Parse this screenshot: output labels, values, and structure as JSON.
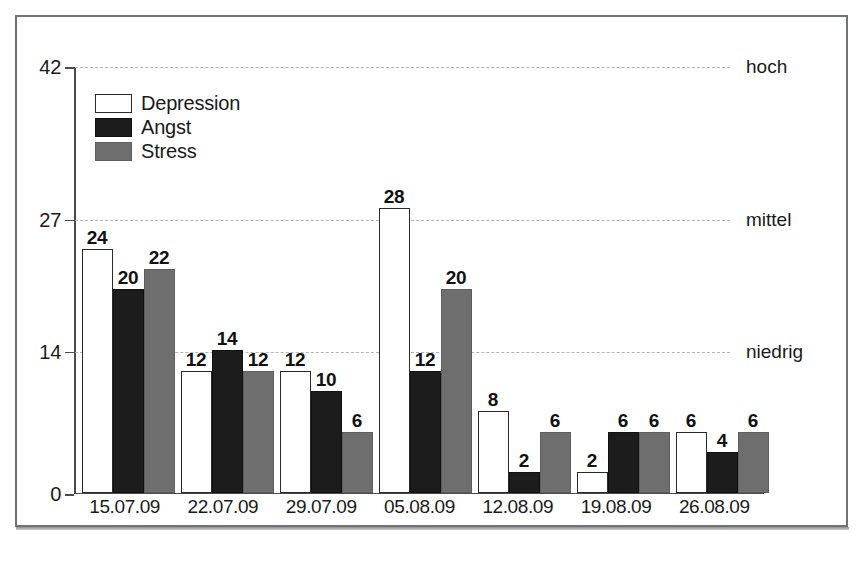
{
  "chart_data": {
    "type": "bar",
    "title": "",
    "subtitle": "",
    "xlabel": "",
    "ylabel": "",
    "categories": [
      "15.07.09",
      "22.07.09",
      "29.07.09",
      "05.08.09",
      "12.08.09",
      "19.08.09",
      "26.08.09"
    ],
    "series": [
      {
        "name": "Depression",
        "color": "#ffffff",
        "values": [
          24,
          12,
          12,
          28,
          8,
          2,
          6
        ]
      },
      {
        "name": "Angst",
        "color": "#1c1c1c",
        "values": [
          20,
          14,
          10,
          12,
          2,
          6,
          4
        ]
      },
      {
        "name": "Stress",
        "color": "#6e6e6e",
        "values": [
          22,
          12,
          6,
          20,
          6,
          6,
          6
        ]
      }
    ],
    "ylim": [
      0,
      42
    ],
    "yticks": [
      0,
      14,
      27,
      42
    ],
    "ytick_labels": [
      "0",
      "14",
      "27",
      "42"
    ],
    "grid": true,
    "gridlines": [
      {
        "value": 42,
        "label": "hoch"
      },
      {
        "value": 27,
        "label": "mittel"
      },
      {
        "value": 14,
        "label": "niedrig"
      }
    ],
    "legend_position": "upper-left",
    "data_labels": true
  }
}
